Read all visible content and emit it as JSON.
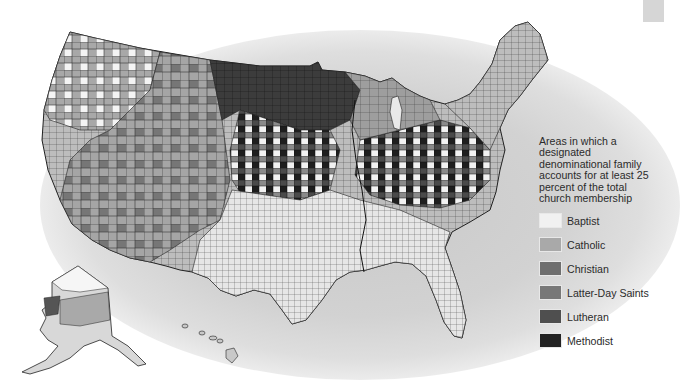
{
  "map": {
    "subject": "United States counties by dominant denominational family",
    "insets": [
      "Alaska",
      "Hawaii"
    ]
  },
  "legend": {
    "title": "Areas in which a designated denominational family accounts for at least 25 percent of the total church membership",
    "items": [
      {
        "label": "Baptist",
        "color": "#f1f1f1"
      },
      {
        "label": "Catholic",
        "color": "#a9a9a9"
      },
      {
        "label": "Christian",
        "color": "#6e6e6e"
      },
      {
        "label": "Latter-Day Saints",
        "color": "#787878"
      },
      {
        "label": "Lutheran",
        "color": "#4f4f4f"
      },
      {
        "label": "Methodist",
        "color": "#232323"
      }
    ]
  },
  "colors": {
    "halo": "#cfcfcf",
    "county_border": "#2a2a2a",
    "background": "#ffffff"
  }
}
